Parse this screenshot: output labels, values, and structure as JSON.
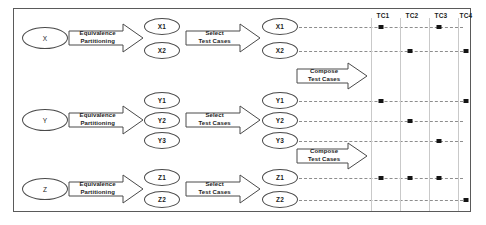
{
  "diagram": {
    "frame": {
      "stroke": "#5a5a5a",
      "background": "#ffffff"
    },
    "labels": {
      "equivalence_partitioning_line1": "Equivalence",
      "equivalence_partitioning_line2": "Partitioning",
      "select_test_cases_line1": "Select",
      "select_test_cases_line2": "Test Cases",
      "compose_test_cases_line1": "Compose",
      "compose_test_cases_line2": "Test Cases"
    },
    "inputs": [
      {
        "id": "x",
        "label": "X"
      },
      {
        "id": "y",
        "label": "Y"
      },
      {
        "id": "z",
        "label": "Z"
      }
    ],
    "partitions": {
      "x": [
        "X1",
        "X2"
      ],
      "y": [
        "Y1",
        "Y2",
        "Y3"
      ],
      "z": [
        "Z1",
        "Z2"
      ]
    },
    "selected": {
      "x": [
        "X1",
        "X2"
      ],
      "y": [
        "Y1",
        "Y2",
        "Y3"
      ],
      "z": [
        "Z1",
        "Z2"
      ]
    },
    "test_case_columns": [
      "TC1",
      "TC2",
      "TC3",
      "TC4"
    ],
    "matrix": [
      {
        "partition": "X1",
        "cells": [
          true,
          false,
          true,
          false
        ]
      },
      {
        "partition": "X2",
        "cells": [
          false,
          true,
          false,
          true
        ]
      },
      {
        "partition": "Y1",
        "cells": [
          true,
          false,
          false,
          true
        ]
      },
      {
        "partition": "Y2",
        "cells": [
          false,
          true,
          false,
          false
        ]
      },
      {
        "partition": "Y3",
        "cells": [
          false,
          false,
          true,
          false
        ]
      },
      {
        "partition": "Z1",
        "cells": [
          true,
          true,
          true,
          false
        ]
      },
      {
        "partition": "Z2",
        "cells": [
          false,
          false,
          false,
          true
        ]
      }
    ],
    "colors": {
      "line": "#4a4a4a",
      "dash": "#8d8d8d",
      "grid": "#c9c9c9",
      "dot": "#141414",
      "text": "#1d1d1d"
    }
  }
}
